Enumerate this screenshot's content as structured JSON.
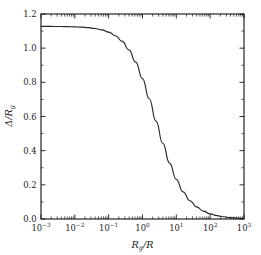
{
  "chart_data": {
    "type": "line",
    "title": "",
    "xlabel": "R_g/R",
    "xlabel_base": "R",
    "xlabel_sub": "g",
    "xlabel_rest": "/R",
    "ylabel": "Δ/R_g",
    "ylabel_base": "Δ/R",
    "ylabel_sub": "g",
    "xscale": "log",
    "yscale": "linear",
    "xlim": [
      0.001,
      1000
    ],
    "ylim": [
      0.0,
      1.2
    ],
    "grid": false,
    "legend": "none",
    "x_tick_labels": [
      "10−3",
      "10−2",
      "10−1",
      "10⁰",
      "10¹",
      "10²",
      "10³"
    ],
    "x_tick_mantissa": [
      "10",
      "10",
      "10",
      "10",
      "10",
      "10",
      "10"
    ],
    "x_tick_exponents": [
      "-3",
      "-2",
      "-1",
      "0",
      "1",
      "2",
      "3"
    ],
    "x_tick_values": [
      0.001,
      0.01,
      0.1,
      1,
      10,
      100,
      1000
    ],
    "y_tick_labels": [
      "0.0",
      "0.2",
      "0.4",
      "0.6",
      "0.8",
      "1.0",
      "1.2"
    ],
    "y_tick_values": [
      0.0,
      0.2,
      0.4,
      0.6,
      0.8,
      1.0,
      1.2
    ],
    "y_minor_tick_values": [
      0.1,
      0.3,
      0.5,
      0.7,
      0.9,
      1.1
    ],
    "series": [
      {
        "name": "Delta over Rg",
        "color": "#262626",
        "x": [
          0.001,
          0.00158,
          0.00251,
          0.00398,
          0.00631,
          0.01,
          0.0158,
          0.0251,
          0.0398,
          0.0631,
          0.1,
          0.158,
          0.251,
          0.398,
          0.631,
          1.0,
          1.58,
          2.51,
          3.98,
          6.31,
          10.0,
          15.8,
          25.1,
          39.8,
          63.1,
          100.0,
          158.0,
          251.0,
          398.0,
          631.0,
          1000.0
        ],
        "y": [
          1.128,
          1.128,
          1.127,
          1.127,
          1.126,
          1.125,
          1.123,
          1.12,
          1.115,
          1.107,
          1.094,
          1.073,
          1.04,
          0.99,
          0.918,
          0.822,
          0.704,
          0.573,
          0.443,
          0.327,
          0.232,
          0.159,
          0.107,
          0.071,
          0.046,
          0.03,
          0.02,
          0.013,
          0.008,
          0.005,
          0.003
        ]
      }
    ]
  },
  "figure": {
    "background_color": "#ffffff",
    "axis_color": "#1a1a1a"
  }
}
